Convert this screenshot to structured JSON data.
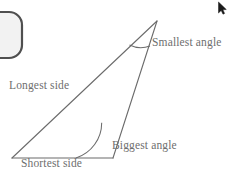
{
  "figure": {
    "type": "geometry-diagram",
    "background_color": "#ffffff",
    "line_color": "#6b6b6b",
    "text_color": "#6e6e6e",
    "labels": {
      "smallest_angle": "Smallest angle",
      "longest_side": "Longest side",
      "biggest_angle": "Biggest angle",
      "shortest_side": "Shortest side"
    },
    "triangle": {
      "vertices": {
        "apex": [
          157,
          21
        ],
        "bottom_left": [
          12,
          158
        ],
        "bottom_right": [
          113,
          158
        ]
      },
      "sides": [
        {
          "name": "longest-side",
          "from": "bottom_left",
          "to": "apex"
        },
        {
          "name": "shortest-side",
          "from": "bottom_left",
          "to": "bottom_right"
        },
        {
          "name": "third-side",
          "from": "bottom_right",
          "to": "apex"
        }
      ],
      "angle_marks": [
        {
          "name": "smallest-angle-arc",
          "vertex": "apex",
          "radius": 26
        },
        {
          "name": "biggest-angle-arc",
          "vertex": "bottom_right",
          "radius": 37
        }
      ]
    }
  },
  "decor": {
    "rounded_shape_name": "rounded-rectangle-shape",
    "rounded_shape_fill": "#f2f2f2",
    "rounded_shape_stroke": "#4f4f4f",
    "cursor_name": "mouse-cursor",
    "cursor_color": "#1a1a1a"
  }
}
